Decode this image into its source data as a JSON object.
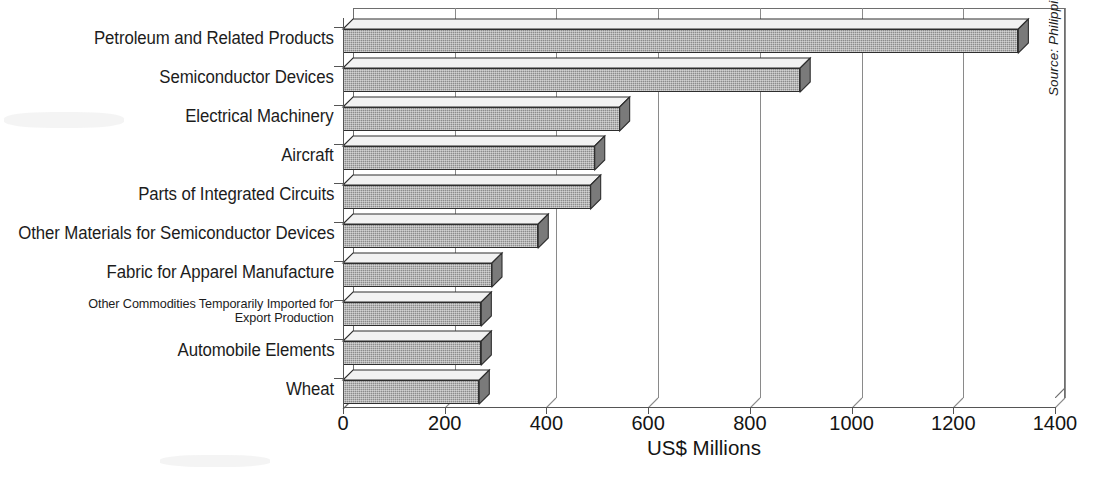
{
  "chart_data": {
    "type": "bar",
    "orientation": "horizontal",
    "title": "",
    "xlabel": "US$ Millions",
    "ylabel": "",
    "xlim": [
      0,
      1400
    ],
    "xticks": [
      0,
      200,
      400,
      600,
      800,
      1000,
      1200,
      1400
    ],
    "xticklabels": [
      "0",
      "200",
      "400",
      "600",
      "800",
      "1000",
      "1200",
      "1400"
    ],
    "grid": "vertical",
    "legend": "none",
    "style": "3d-bars-grayscale",
    "categories": [
      "Petroleum and Related Products",
      "Semiconductor Devices",
      "Electrical Machinery",
      "Aircraft",
      "Parts of Integrated Circuits",
      "Other Materials for Semiconductor Devices",
      "Fabric for Apparel Manufacture",
      "Other Commodities Temporarily Imported for\nExport Production",
      "Automobile Elements",
      "Wheat"
    ],
    "values": [
      1328,
      899,
      544,
      495,
      487,
      384,
      293,
      272,
      272,
      268
    ],
    "annotations": [
      "Source: Philippine Department of Trade and Industry"
    ]
  },
  "axis": {
    "x_title": "US$ Millions",
    "tick_labels": [
      "0",
      "200",
      "400",
      "600",
      "800",
      "1000",
      "1200",
      "1400"
    ]
  },
  "categories": [
    {
      "label": "Petroleum and Related Products",
      "value": 1328,
      "small": false
    },
    {
      "label": "Semiconductor Devices",
      "value": 899,
      "small": false
    },
    {
      "label": "Electrical Machinery",
      "value": 544,
      "small": false
    },
    {
      "label": "Aircraft",
      "value": 495,
      "small": false
    },
    {
      "label": "Parts of Integrated Circuits",
      "value": 487,
      "small": false
    },
    {
      "label": "Other Materials for Semiconductor Devices",
      "value": 384,
      "small": false
    },
    {
      "label": "Fabric for Apparel Manufacture",
      "value": 293,
      "small": false
    },
    {
      "label": "Other Commodities Temporarily Imported for\nExport Production",
      "value": 272,
      "small": true
    },
    {
      "label": "Automobile Elements",
      "value": 272,
      "small": false
    },
    {
      "label": "Wheat",
      "value": 268,
      "small": false
    }
  ],
  "source": {
    "text": "Source: Philippine Department of Trade and Industry"
  },
  "colors": {
    "bar_face": "#8c8c8c",
    "bar_top": "#f2f2f2",
    "bar_side": "#7a7a7a",
    "outline": "#2e2e2e",
    "axis": "#555555",
    "grid": "#8a8a8a",
    "text": "#1c1c1c",
    "background": "#ffffff"
  }
}
